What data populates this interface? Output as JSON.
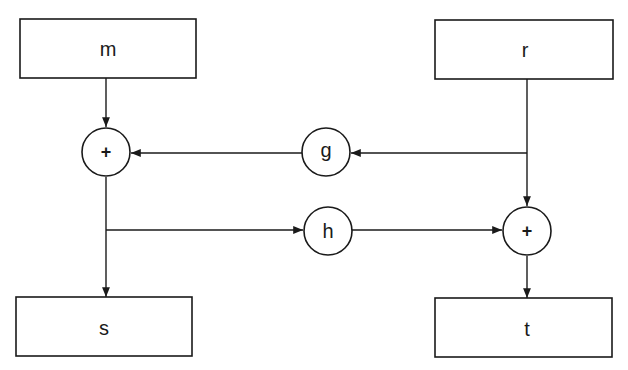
{
  "diagram": {
    "type": "block-diagram",
    "boxes": {
      "m": {
        "label": "m"
      },
      "r": {
        "label": "r"
      },
      "s": {
        "label": "s"
      },
      "t": {
        "label": "t"
      }
    },
    "operators": {
      "sum_left": {
        "label": "+"
      },
      "sum_right": {
        "label": "+"
      }
    },
    "gains": {
      "g": {
        "label": "g"
      },
      "h": {
        "label": "h"
      }
    },
    "edges": [
      {
        "from": "m",
        "to": "sum_left"
      },
      {
        "from": "r",
        "to": "g"
      },
      {
        "from": "g",
        "to": "sum_left"
      },
      {
        "from": "r",
        "to": "sum_right"
      },
      {
        "from": "sum_left",
        "to": "h"
      },
      {
        "from": "h",
        "to": "sum_right"
      },
      {
        "from": "sum_left",
        "to": "s"
      },
      {
        "from": "sum_right",
        "to": "t"
      }
    ],
    "colors": {
      "stroke": "#1a1a1a",
      "background": "#ffffff"
    }
  }
}
